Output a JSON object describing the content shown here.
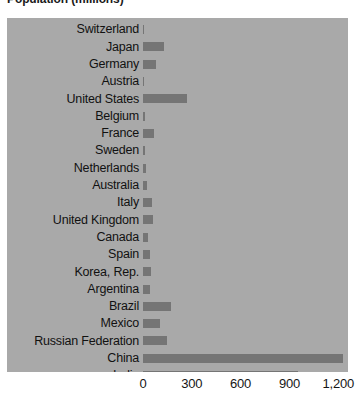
{
  "chart_data": {
    "type": "bar",
    "orientation": "horizontal",
    "title": "Population (millions)",
    "xlabel": "",
    "ylabel": "",
    "grid": false,
    "legend": "none",
    "xlim": [
      0,
      1260
    ],
    "xticks": [
      0,
      300,
      600,
      900,
      1200
    ],
    "xtick_labels": [
      "0",
      "300",
      "600",
      "900",
      "1,200"
    ],
    "bar_color": "#757575",
    "plot_background": "#a9a9a9",
    "categories": [
      "Switzerland",
      "Japan",
      "Germany",
      "Austria",
      "United States",
      "Belgium",
      "France",
      "Sweden",
      "Netherlands",
      "Australia",
      "Italy",
      "United Kingdom",
      "Canada",
      "Spain",
      "Korea, Rep.",
      "Argentina",
      "Brazil",
      "Mexico",
      "Russian Federation",
      "China",
      "India"
    ],
    "values": [
      8,
      127,
      82,
      9,
      270,
      11,
      65,
      10,
      17,
      23,
      58,
      60,
      32,
      45,
      48,
      40,
      170,
      105,
      145,
      1230,
      950
    ]
  },
  "axis": {
    "tick_0": "0",
    "tick_1": "300",
    "tick_2": "600",
    "tick_3": "900",
    "tick_4": "1,200"
  }
}
